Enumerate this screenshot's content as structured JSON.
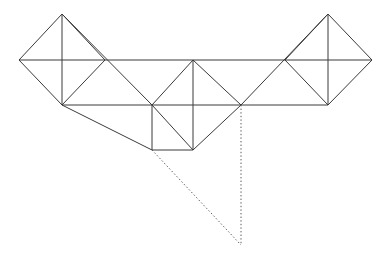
{
  "figure": {
    "type": "line-diagram",
    "width": 387,
    "height": 255,
    "background_color": "#ffffff",
    "solid_line_color": "#3a3a3a",
    "dotted_line_color": "#5a5a5a",
    "line_width": 1
  },
  "geometry": {
    "description": "Symmetric planar truss: two outer cross-braced diamond panels, a central diamond panel, a square panel hanging below the left-centre, plus two dotted construction lines converging below the figure.",
    "nodes": [
      {
        "id": "L0",
        "name": "left-tip",
        "x": 19,
        "y": 60
      },
      {
        "id": "L1",
        "name": "left-top-apex",
        "x": 62,
        "y": 14
      },
      {
        "id": "L2",
        "name": "left-mid",
        "x": 62,
        "y": 60
      },
      {
        "id": "L3",
        "name": "left-bottom",
        "x": 62,
        "y": 105
      },
      {
        "id": "L4",
        "name": "left-inner-chord-node",
        "x": 105,
        "y": 60
      },
      {
        "id": "C0",
        "name": "centre-left-node",
        "x": 152,
        "y": 105
      },
      {
        "id": "C1",
        "name": "centre-top-apex",
        "x": 193,
        "y": 60
      },
      {
        "id": "C2",
        "name": "centre-mid",
        "x": 193,
        "y": 105
      },
      {
        "id": "C3",
        "name": "centre-bottom",
        "x": 193,
        "y": 150
      },
      {
        "id": "C4",
        "name": "centre-right-node",
        "x": 241,
        "y": 105
      },
      {
        "id": "R4",
        "name": "right-inner-chord-node",
        "x": 285,
        "y": 60
      },
      {
        "id": "R3",
        "name": "right-bottom",
        "x": 328,
        "y": 105
      },
      {
        "id": "R2",
        "name": "right-mid",
        "x": 328,
        "y": 60
      },
      {
        "id": "R1",
        "name": "right-top-apex",
        "x": 328,
        "y": 14
      },
      {
        "id": "R0",
        "name": "right-tip",
        "x": 372,
        "y": 60
      },
      {
        "id": "S0",
        "name": "square-bottom-left",
        "x": 152,
        "y": 150
      },
      {
        "id": "P0",
        "name": "projection-convergence-point",
        "x": 241,
        "y": 245
      }
    ],
    "solid_members": [
      {
        "name": "top-chord-left",
        "points": "19,60 372,60"
      },
      {
        "name": "left-upper-left-rafter",
        "points": "19,60 62,14"
      },
      {
        "name": "left-upper-right-rafter",
        "points": "62,14 105,60"
      },
      {
        "name": "left-vertical-post",
        "points": "62,14 62,105"
      },
      {
        "name": "left-lower-left-brace",
        "points": "19,60 62,105"
      },
      {
        "name": "left-lower-right-brace",
        "points": "62,105 105,60"
      },
      {
        "name": "left-long-diagonal",
        "points": "62,14 152,105"
      },
      {
        "name": "left-bottom-chord",
        "points": "62,105 241,105"
      },
      {
        "name": "left-bottom-long-diagonal",
        "points": "62,105 152,150"
      },
      {
        "name": "centre-left-rafter",
        "points": "152,105 193,60"
      },
      {
        "name": "centre-right-rafter",
        "points": "193,60 241,105"
      },
      {
        "name": "centre-vertical-post",
        "points": "193,60 193,150"
      },
      {
        "name": "centre-lower-left-brace",
        "points": "152,105 193,150"
      },
      {
        "name": "centre-lower-right-brace",
        "points": "193,150 241,105"
      },
      {
        "name": "square-left-side",
        "points": "152,105 152,150"
      },
      {
        "name": "square-bottom-side",
        "points": "152,150 193,150"
      },
      {
        "name": "right-long-diagonal",
        "points": "241,105 328,14"
      },
      {
        "name": "right-bottom-chord",
        "points": "241,105 328,105"
      },
      {
        "name": "right-upper-left-rafter",
        "points": "285,60 328,14"
      },
      {
        "name": "right-upper-right-rafter",
        "points": "328,14 372,60"
      },
      {
        "name": "right-vertical-post",
        "points": "328,14 328,105"
      },
      {
        "name": "right-lower-left-brace",
        "points": "285,60 328,105"
      },
      {
        "name": "right-lower-right-brace",
        "points": "328,105 372,60"
      }
    ],
    "dotted_members": [
      {
        "name": "projection-diagonal",
        "points": "152,150 241,245"
      },
      {
        "name": "projection-vertical",
        "points": "241,105 241,245"
      }
    ]
  }
}
